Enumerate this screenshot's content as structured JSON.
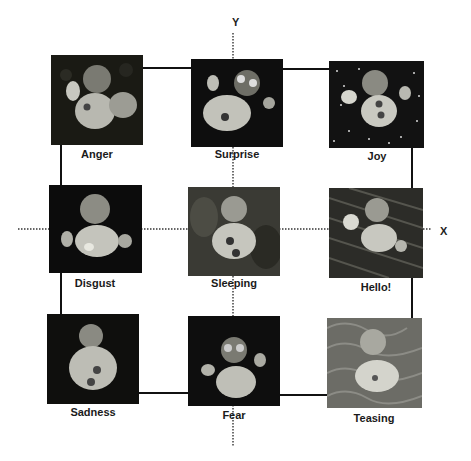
{
  "diagram": {
    "axes": {
      "x_label": "X",
      "y_label": "Y"
    },
    "emotions": [
      {
        "label": "Anger",
        "row": 0,
        "col": 0,
        "background": "dark foliage"
      },
      {
        "label": "Surprise",
        "row": 0,
        "col": 1,
        "background": "dark"
      },
      {
        "label": "Joy",
        "row": 0,
        "col": 2,
        "background": "starry"
      },
      {
        "label": "Disgust",
        "row": 1,
        "col": 0,
        "background": "dark"
      },
      {
        "label": "Sleeping",
        "row": 1,
        "col": 1,
        "background": "foliage"
      },
      {
        "label": "Hello!",
        "row": 1,
        "col": 2,
        "background": "streaked"
      },
      {
        "label": "Sadness",
        "row": 2,
        "col": 0,
        "background": "dark"
      },
      {
        "label": "Fear",
        "row": 2,
        "col": 1,
        "background": "dark"
      },
      {
        "label": "Teasing",
        "row": 2,
        "col": 2,
        "background": "textured"
      }
    ]
  }
}
